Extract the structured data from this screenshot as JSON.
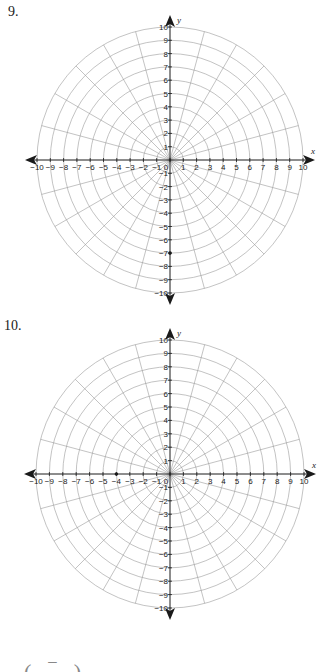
{
  "problems": [
    {
      "label": "9.",
      "grid": {
        "type": "polar",
        "circles": [
          1,
          2,
          3,
          4,
          5,
          6,
          7,
          8,
          9,
          10
        ],
        "spoke_step_deg": 15,
        "x_ticks": [
          "-10",
          "-9",
          "-8",
          "-7",
          "-6",
          "-5",
          "-4",
          "-3",
          "-2",
          "-1",
          "0",
          "1",
          "2",
          "3",
          "4",
          "5",
          "6",
          "7",
          "8",
          "9",
          "10"
        ],
        "y_ticks": [
          "10",
          "9",
          "8",
          "7",
          "6",
          "5",
          "4",
          "3",
          "2",
          "1",
          "-1",
          "-2",
          "-3",
          "-4",
          "-5",
          "-6",
          "-7",
          "-8",
          "-9",
          "-10"
        ],
        "x_axis_label": "x",
        "y_axis_label": "y",
        "points": [
          {
            "x": 0,
            "y": -7
          }
        ]
      }
    },
    {
      "label": "10.",
      "grid": {
        "type": "polar",
        "circles": [
          1,
          2,
          3,
          4,
          5,
          6,
          7,
          8,
          9,
          10
        ],
        "spoke_step_deg": 15,
        "x_ticks": [
          "-10",
          "-9",
          "-8",
          "-7",
          "-6",
          "-5",
          "-4",
          "-3",
          "-2",
          "-1",
          "0",
          "1",
          "2",
          "3",
          "4",
          "5",
          "6",
          "7",
          "8",
          "9",
          "10"
        ],
        "y_ticks": [
          "10",
          "9",
          "8",
          "7",
          "6",
          "5",
          "4",
          "3",
          "2",
          "1",
          "-1",
          "-2",
          "-3",
          "-4",
          "-5",
          "-6",
          "-7",
          "-8",
          "-9",
          "-10"
        ],
        "x_axis_label": "x",
        "y_axis_label": "y",
        "points": [
          {
            "x": -4,
            "y": 0
          }
        ]
      }
    }
  ],
  "footer_partial_text": "( ‾ )",
  "colors": {
    "grid_line": "#9a9a9a",
    "axis": "#1a1a1a",
    "text": "#1a1a1a"
  },
  "chart_data": [
    {
      "type": "scatter",
      "title": "9.",
      "subtype": "polar grid",
      "xlabel": "x",
      "ylabel": "y",
      "xlim": [
        -10,
        10
      ],
      "ylim": [
        -10,
        10
      ],
      "grid": true,
      "radial_circles": [
        1,
        2,
        3,
        4,
        5,
        6,
        7,
        8,
        9,
        10
      ],
      "angular_spokes_deg": 15,
      "x": [
        0
      ],
      "y": [
        -7
      ]
    },
    {
      "type": "scatter",
      "title": "10.",
      "subtype": "polar grid",
      "xlabel": "x",
      "ylabel": "y",
      "xlim": [
        -10,
        10
      ],
      "ylim": [
        -10,
        10
      ],
      "grid": true,
      "radial_circles": [
        1,
        2,
        3,
        4,
        5,
        6,
        7,
        8,
        9,
        10
      ],
      "angular_spokes_deg": 15,
      "x": [
        -4
      ],
      "y": [
        0
      ]
    }
  ]
}
